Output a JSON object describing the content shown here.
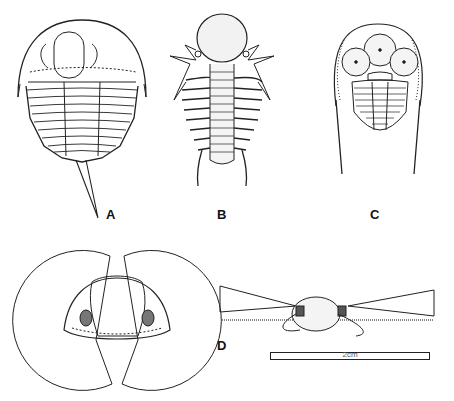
{
  "figure": {
    "panels": [
      {
        "id": "A",
        "label": "A",
        "subject": "trilobite-long-tail-spine"
      },
      {
        "id": "B",
        "label": "B",
        "subject": "trilobite-spiny-bulbous-glabella"
      },
      {
        "id": "C",
        "label": "C",
        "subject": "trilobite-large-eyes-long-genal-spines"
      },
      {
        "id": "D",
        "label": "D",
        "subject": "trilobite-front-and-side-views-with-visual-fields"
      }
    ],
    "scale_bar": {
      "label": "2cm"
    }
  }
}
